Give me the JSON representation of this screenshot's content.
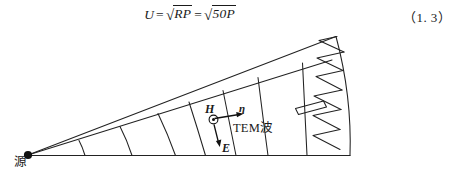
{
  "page": {
    "background": "#ffffff",
    "ink": "#1a1a1a"
  },
  "equation": {
    "name": "characteristic-impedance-voltage",
    "lhs": "U",
    "equals_1": "=",
    "radical_sign_1": "√",
    "radicand_1": "RP",
    "equals_2": "=",
    "radical_sign_2": "√",
    "radicand_2": "50P",
    "plain_text": "U = √(RP) = √(50P)",
    "number": "（1. 3）"
  },
  "figure": {
    "name": "tem-horn-waveguide-diagram",
    "caption_labels": {
      "source": "源",
      "h_field": "H",
      "e_field": "E",
      "eta": "η",
      "wave": "TEM波"
    },
    "elements": {
      "apex_dot": "source-point",
      "h_symbol": "circle-dot-out-of-page",
      "e_arrow": "down-arrow",
      "eta_arrow": "right-arrow",
      "load_element": "tilted-rectangle-resistor",
      "absorber": "sawtooth-absorber-array",
      "sawtooth_count": 6,
      "arc_count": 7
    },
    "geometry": {
      "apex": [
        28,
        125
      ],
      "bottom_right": [
        349,
        125
      ],
      "top_right": [
        335,
        7
      ],
      "upper_edge_inner_angle_deg": -20.2,
      "upper_edge_outer_angle_deg": -22.5
    },
    "colors": {
      "line": "#222222",
      "fill": "#ffffff"
    }
  }
}
